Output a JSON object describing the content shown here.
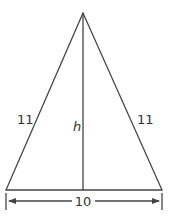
{
  "diagram": {
    "type": "isosceles-triangle",
    "left_side_label": "11",
    "right_side_label": "11",
    "height_label": "h",
    "base_label": "10",
    "stroke_color": "#444444"
  }
}
